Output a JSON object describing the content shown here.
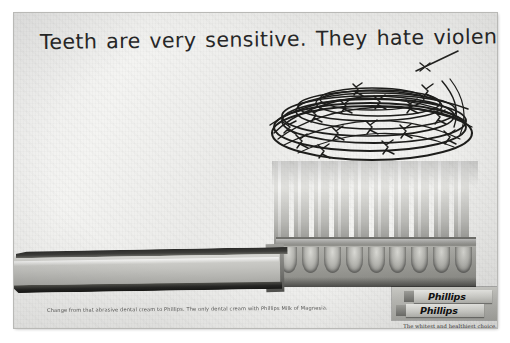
{
  "ad": {
    "headline": "Teeth are very sensitive. They hate violence.",
    "body_copy": "Change from that abrasive dental cream to Phillips. The only dental cream with Phillips Milk of Magnesia.",
    "logo": {
      "brand_top": "Phillips",
      "brand_bottom": "Phillips",
      "tagline": "The whitest and healthiest choice."
    },
    "imagery": {
      "subject": "toothbrush-with-barbed-wire-bristles",
      "background_color": "#f1f1ef",
      "ink_color": "#272727"
    }
  }
}
